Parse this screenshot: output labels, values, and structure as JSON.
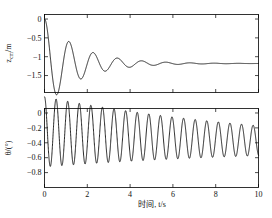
{
  "figure": {
    "background": "#ffffff",
    "line_color": "#000000",
    "axis_color": "#000000"
  },
  "xaxis": {
    "label_cn": "时间",
    "label_sep": ", ",
    "label_var": "t",
    "label_unit": "/s",
    "full_label": "时间, t/s",
    "ticks": [
      "0",
      "2",
      "4",
      "6",
      "8",
      "10"
    ],
    "tick_values": [
      0,
      2,
      4,
      6,
      8,
      10
    ],
    "range": [
      0,
      10
    ]
  },
  "panels": [
    {
      "id": "top",
      "ylabel_main": "z",
      "ylabel_sub": "cm",
      "ylabel_unit": "/m",
      "ylabel_full": "z_cm/m",
      "yticks": [
        "0",
        "-0.5",
        "-1",
        "-1.5"
      ],
      "ytick_values": [
        0,
        -0.5,
        -1,
        -1.5
      ],
      "ylim": [
        -1.95,
        0.12
      ]
    },
    {
      "id": "bottom",
      "ylabel_main": "θ",
      "ylabel_sub": "",
      "ylabel_unit": "/(°)",
      "ylabel_full": "θ/(°)",
      "yticks": [
        "0",
        "-0.2",
        "-0.4",
        "-0.6",
        "-0.8"
      ],
      "ytick_values": [
        0,
        -0.2,
        -0.4,
        -0.6,
        -0.8
      ],
      "ylim": [
        -1.0,
        0.06
      ]
    }
  ],
  "chart_data": [
    {
      "type": "line",
      "id": "z-cm-displacement",
      "title": "",
      "xlabel": "时间, t/s",
      "ylabel": "z_cm/m",
      "xlim": [
        0,
        10
      ],
      "ylim": [
        -1.95,
        0.12
      ],
      "grid": false,
      "legend": null,
      "model": {
        "description": "damped oscillation settling to steady offset",
        "equilibrium": -1.18,
        "initial_value": 0,
        "amplitude": 1.25,
        "damping_rate": 0.62,
        "angular_frequency": 5.55,
        "phase": 1.5708
      },
      "key_points": [
        {
          "t": 0.0,
          "z": 0.0
        },
        {
          "t": 0.52,
          "z": -1.83
        },
        {
          "t": 1.12,
          "z": -0.66
        },
        {
          "t": 1.68,
          "z": -1.55
        },
        {
          "t": 2.22,
          "z": -0.88
        },
        {
          "t": 2.78,
          "z": -1.42
        },
        {
          "t": 3.3,
          "z": -1.0
        },
        {
          "t": 3.9,
          "z": -1.33
        },
        {
          "t": 4.4,
          "z": -1.08
        },
        {
          "t": 5.0,
          "z": -1.28
        },
        {
          "t": 6.0,
          "z": -1.14
        },
        {
          "t": 7.0,
          "z": -1.21
        },
        {
          "t": 8.0,
          "z": -1.17
        },
        {
          "t": 9.0,
          "z": -1.19
        },
        {
          "t": 10.0,
          "z": -1.18
        }
      ]
    },
    {
      "type": "line",
      "id": "theta-angle",
      "title": "",
      "xlabel": "时间, t/s",
      "ylabel": "θ/(°)",
      "xlim": [
        0,
        10
      ],
      "ylim": [
        -1.0,
        0.06
      ],
      "grid": false,
      "legend": null,
      "model": {
        "description": "lightly damped oscillation about mid offset",
        "equilibrium": -0.46,
        "initial_value": 0,
        "amplitude": 0.47,
        "damping_rate": 0.085,
        "angular_frequency": 11.6,
        "phase": 1.5708
      },
      "key_points": [
        {
          "t": 0.0,
          "theta": 0.0
        },
        {
          "t": 0.27,
          "theta": -0.92
        },
        {
          "t": 0.55,
          "theta": -0.02
        },
        {
          "t": 0.82,
          "theta": -0.9
        },
        {
          "t": 1.1,
          "theta": -0.04
        },
        {
          "t": 2.0,
          "theta": -0.07
        },
        {
          "t": 3.0,
          "theta": -0.1
        },
        {
          "t": 5.0,
          "theta": -0.16
        },
        {
          "t": 7.0,
          "theta": -0.22
        },
        {
          "t": 10.0,
          "theta": -0.27
        }
      ]
    }
  ]
}
